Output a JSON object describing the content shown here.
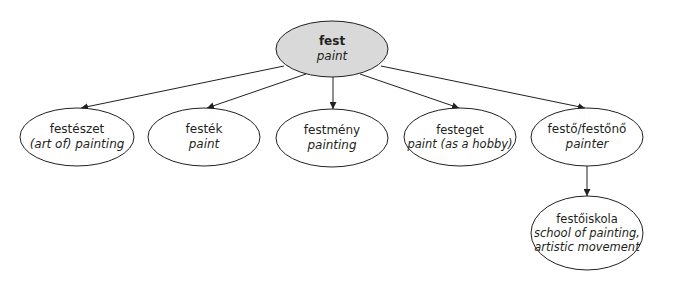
{
  "diagram": {
    "type": "tree",
    "colors": {
      "root_fill": "#d9d9d9",
      "node_fill": "#ffffff",
      "stroke": "#231f20",
      "background": "#ffffff"
    },
    "root": {
      "word": "fest",
      "gloss": "paint"
    },
    "children": [
      {
        "word": "festészet",
        "gloss": "(art of) painting"
      },
      {
        "word": "festék",
        "gloss": "paint"
      },
      {
        "word": "festmény",
        "gloss": "painting"
      },
      {
        "word": "festeget",
        "gloss": "paint (as a hobby)"
      },
      {
        "word": "festő/festőnő",
        "gloss": "painter"
      }
    ],
    "grandchild": {
      "parent": "festő/festőnő",
      "word": "festőiskola",
      "gloss_line1": "school of painting,",
      "gloss_line2": "artistic movement"
    }
  }
}
